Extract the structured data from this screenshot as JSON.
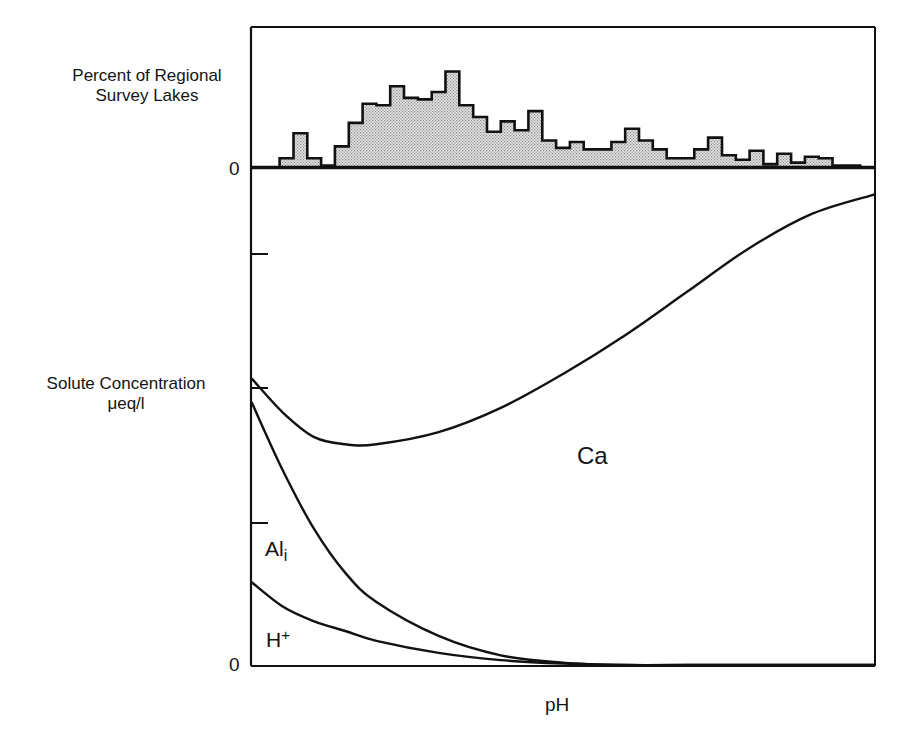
{
  "chart_data": [
    {
      "type": "bar",
      "subtype": "histogram (step outline, stippled fill)",
      "title": "",
      "ylabel": "Percent of Regional Survey Lakes",
      "xlabel": "pH (shared axis)",
      "y_tick_labels": [
        "0"
      ],
      "fill_color": "#c8c8c8",
      "outline_color": "#111111",
      "relative_values_note": "Relative bar heights (unitless; y-axis only labeled at 0). Bins run left to right along pH axis.",
      "values": [
        0,
        0,
        0.6,
        2.3,
        0.6,
        0.1,
        1.4,
        3.0,
        4.3,
        4.2,
        5.5,
        4.7,
        4.6,
        5.1,
        6.5,
        4.2,
        3.4,
        2.4,
        3.1,
        2.5,
        3.8,
        1.8,
        1.3,
        1.7,
        1.2,
        1.2,
        1.7,
        2.6,
        1.8,
        1.2,
        0.6,
        0.6,
        1.2,
        2.0,
        0.8,
        0.5,
        1.1,
        0.2,
        0.9,
        0.3,
        0.7,
        0.6,
        0.1,
        0.1,
        0
      ]
    },
    {
      "type": "line",
      "title": "",
      "ylabel": "Solute Concentration μeq/l",
      "xlabel": "pH",
      "y_tick_labels": [
        "0"
      ],
      "y_ticks_unlabeled": 3,
      "x_ticks": "none",
      "grid": false,
      "legend": "inline labels",
      "x": [
        0,
        0.05,
        0.1,
        0.15,
        0.2,
        0.3,
        0.4,
        0.5,
        0.6,
        0.7,
        0.8,
        0.9,
        1.0
      ],
      "series": [
        {
          "name": "Ca",
          "values": [
            0.59,
            0.52,
            0.47,
            0.455,
            0.455,
            0.48,
            0.53,
            0.6,
            0.68,
            0.77,
            0.86,
            0.93,
            0.97
          ]
        },
        {
          "name": "Al_i",
          "values": [
            0.54,
            0.4,
            0.28,
            0.19,
            0.13,
            0.06,
            0.02,
            0.005,
            0,
            0,
            0,
            0,
            0
          ]
        },
        {
          "name": "H+",
          "values": [
            0.17,
            0.12,
            0.09,
            0.07,
            0.05,
            0.025,
            0.01,
            0.003,
            0,
            0,
            0,
            0,
            0
          ]
        }
      ],
      "annotations": [
        "Ca",
        "Al_i",
        "H+"
      ]
    }
  ],
  "labels": {
    "hist_ylabel": "Percent of Regional Survey Lakes",
    "hist_zero": "0",
    "main_ylabel_line1": "Solute Concentration",
    "main_ylabel_line2": "μeq/l",
    "main_zero": "0",
    "xlabel": "pH",
    "ca": "Ca",
    "al": "Al",
    "al_sub": "i",
    "h": "H",
    "h_sup": "+"
  },
  "colors": {
    "ink": "#111111",
    "stipple": "#c6c6c6",
    "background": "#ffffff"
  }
}
